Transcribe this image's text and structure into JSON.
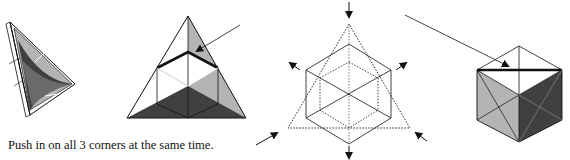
{
  "caption": "Push in on all 3 corners at the same time.",
  "colors": {
    "light_gray": "#b4b4b4",
    "mid_gray": "#888888",
    "dark_gray": "#404040",
    "line": "#111111"
  },
  "figures": [
    {
      "name": "folded-tetrahedron-perspective"
    },
    {
      "name": "triangle-with-cube-corner"
    },
    {
      "name": "cube-and-triangle-overlay-dotted"
    },
    {
      "name": "finished-cube"
    }
  ]
}
